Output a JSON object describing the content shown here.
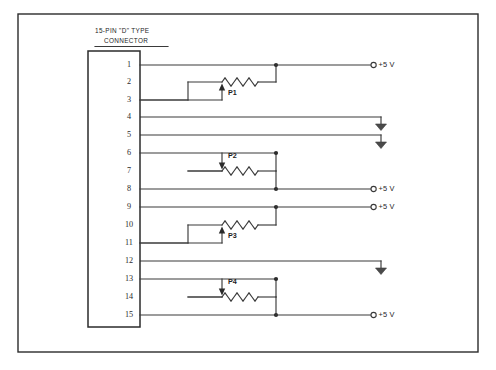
{
  "diagram": {
    "title_line1": "15-PIN \"D\" TYPE",
    "title_line2": "CONNECTOR",
    "frame": {
      "x": 18,
      "y": 14,
      "width": 460,
      "height": 338
    },
    "connector_box": {
      "x": 88,
      "y": 51,
      "width": 52,
      "height": 276
    },
    "colors": {
      "wire": "#3a3a3a",
      "border": "#2b2b2b",
      "text": "#1e1e1e",
      "ground_fill": "#4a4a4a",
      "background": "#ffffff"
    }
  },
  "pins": [
    {
      "number": "1",
      "y": 65,
      "connected": true
    },
    {
      "number": "2",
      "y": 82,
      "connected": false
    },
    {
      "number": "3",
      "y": 100,
      "connected": true
    },
    {
      "number": "4",
      "y": 117,
      "connected": true
    },
    {
      "number": "5",
      "y": 135,
      "connected": true
    },
    {
      "number": "6",
      "y": 153,
      "connected": true
    },
    {
      "number": "7",
      "y": 171,
      "connected": false
    },
    {
      "number": "8",
      "y": 189,
      "connected": true
    },
    {
      "number": "9",
      "y": 207,
      "connected": true
    },
    {
      "number": "10",
      "y": 225,
      "connected": false
    },
    {
      "number": "11",
      "y": 243,
      "connected": true
    },
    {
      "number": "12",
      "y": 261,
      "connected": true
    },
    {
      "number": "13",
      "y": 279,
      "connected": true
    },
    {
      "number": "14",
      "y": 297,
      "connected": false
    },
    {
      "number": "15",
      "y": 315,
      "connected": true
    }
  ],
  "potentiometers": [
    {
      "label": "P1",
      "wiper_direction": "up",
      "resistor_y": 82,
      "label_x": 228,
      "label_y": 95
    },
    {
      "label": "P2",
      "wiper_direction": "down",
      "resistor_y": 171,
      "label_x": 228,
      "label_y": 158
    },
    {
      "label": "P3",
      "wiper_direction": "up",
      "resistor_y": 225,
      "label_x": 228,
      "label_y": 238
    },
    {
      "label": "P4",
      "wiper_direction": "down",
      "resistor_y": 297,
      "label_x": 228,
      "label_y": 284
    }
  ],
  "terminals": [
    {
      "type": "supply",
      "label": "+5 V",
      "pin": "1",
      "y": 65,
      "x": 371
    },
    {
      "type": "ground",
      "label": "",
      "pin": "4",
      "y": 117,
      "x": 381
    },
    {
      "type": "ground",
      "label": "",
      "pin": "5",
      "y": 135,
      "x": 381
    },
    {
      "type": "supply",
      "label": "+5 V",
      "pin": "8",
      "y": 189,
      "x": 371
    },
    {
      "type": "supply",
      "label": "+5 V",
      "pin": "9",
      "y": 207,
      "x": 371
    },
    {
      "type": "ground",
      "label": "",
      "pin": "12",
      "y": 261,
      "x": 381
    },
    {
      "type": "supply",
      "label": "+5 V",
      "pin": "15",
      "y": 315,
      "x": 371
    }
  ],
  "networks": [
    {
      "name": "P1-network",
      "pot": "P1",
      "top_pin": "1",
      "wiper_pin": "3",
      "bus_x": 276,
      "res_left_x": 188,
      "res_right_x": 276,
      "wiper_x": 222,
      "top_y": 65,
      "res_y": 82,
      "wiper_y": 100
    },
    {
      "name": "P2-network",
      "pot": "P2",
      "top_pin": "6",
      "wiper_pin": "8",
      "bus_x": 276,
      "res_left_x": 188,
      "res_right_x": 276,
      "wiper_x": 222,
      "top_y": 153,
      "res_y": 171,
      "wiper_y": 189
    },
    {
      "name": "P3-network",
      "pot": "P3",
      "top_pin": "9",
      "wiper_pin": "11",
      "bus_x": 276,
      "res_left_x": 188,
      "res_right_x": 276,
      "wiper_x": 222,
      "top_y": 207,
      "res_y": 225,
      "wiper_y": 243
    },
    {
      "name": "P4-network",
      "pot": "P4",
      "top_pin": "13",
      "wiper_pin": "15",
      "bus_x": 276,
      "res_left_x": 188,
      "res_right_x": 276,
      "wiper_x": 222,
      "top_y": 279,
      "res_y": 297,
      "wiper_y": 315
    }
  ],
  "direct_runs": [
    {
      "name": "pin-4-ground-run",
      "pin": "4",
      "y": 117,
      "end_x": 381
    },
    {
      "name": "pin-5-ground-run",
      "pin": "5",
      "y": 135,
      "end_x": 381
    },
    {
      "name": "pin-12-ground-run",
      "pin": "12",
      "y": 261,
      "end_x": 381
    }
  ]
}
